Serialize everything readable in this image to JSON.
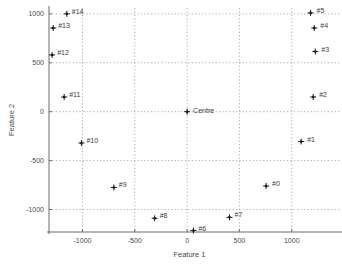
{
  "chart_data": {
    "type": "scatter",
    "title": "",
    "xlabel": "Feature 1",
    "ylabel": "Feature 2",
    "xlim": [
      -1320,
      1270
    ],
    "ylim": [
      -1230,
      1060
    ],
    "xticks": [
      -1000,
      -500,
      0,
      500,
      1000
    ],
    "xticklabels": [
      "-1000",
      "-500",
      "0",
      "500",
      "1000"
    ],
    "yticks": [
      -1000,
      -500,
      0,
      500,
      1000
    ],
    "yticklabels": [
      "-1000",
      "-500",
      "0",
      "500",
      "1000"
    ],
    "grid": true,
    "legend": null,
    "marker": "+",
    "points": [
      {
        "label": "#5",
        "x": 1180,
        "y": 1010,
        "label_dx": 6,
        "label_dy": -3
      },
      {
        "label": "#4",
        "x": 1215,
        "y": 855,
        "label_dx": 6,
        "label_dy": -3
      },
      {
        "label": "#3",
        "x": 1225,
        "y": 615,
        "label_dx": 6,
        "label_dy": -3
      },
      {
        "label": "#2",
        "x": 1205,
        "y": 150,
        "label_dx": 6,
        "label_dy": -3
      },
      {
        "label": "#1",
        "x": 1090,
        "y": -305,
        "label_dx": 6,
        "label_dy": -3
      },
      {
        "label": "#0",
        "x": 755,
        "y": -760,
        "label_dx": 6,
        "label_dy": -3
      },
      {
        "label": "Centre",
        "x": 0,
        "y": 0,
        "label_dx": 6,
        "label_dy": -2
      },
      {
        "label": "#14",
        "x": -1150,
        "y": 1000,
        "label_dx": 5,
        "label_dy": -3
      },
      {
        "label": "#13",
        "x": -1280,
        "y": 855,
        "label_dx": 5,
        "label_dy": -3
      },
      {
        "label": "#12",
        "x": -1290,
        "y": 580,
        "label_dx": 5,
        "label_dy": -3
      },
      {
        "label": "#11",
        "x": -1175,
        "y": 150,
        "label_dx": 5,
        "label_dy": -3
      },
      {
        "label": "#10",
        "x": -1010,
        "y": -320,
        "label_dx": 5,
        "label_dy": -3
      },
      {
        "label": "#9",
        "x": -700,
        "y": -775,
        "label_dx": 5,
        "label_dy": -3
      },
      {
        "label": "#8",
        "x": -310,
        "y": -1090,
        "label_dx": 5,
        "label_dy": -3
      },
      {
        "label": "#7",
        "x": 405,
        "y": -1080,
        "label_dx": 5,
        "label_dy": -3
      },
      {
        "label": "#6",
        "x": 60,
        "y": -1215,
        "label_dx": 5,
        "label_dy": -3
      }
    ]
  },
  "colors": {
    "axis": "#6b6b6b",
    "grid": "#8a8a8a",
    "marker": "#1a1a1a",
    "text": "#4a4a4a",
    "background": "#ffffff"
  }
}
